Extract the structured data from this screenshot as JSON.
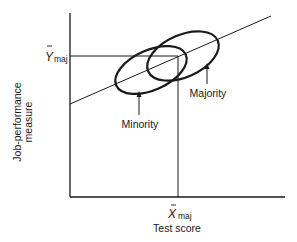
{
  "diagram": {
    "type": "regression-scatter-ellipses",
    "axes": {
      "xlabel": "Test score",
      "ylabel_line1": "Job-performance",
      "ylabel_line2": "measure"
    },
    "markers": {
      "y_mean_symbol": "Y",
      "y_mean_subscript": "maj",
      "x_mean_symbol": "X",
      "x_mean_subscript": "maj"
    },
    "groups": [
      {
        "name": "minority",
        "label": "Minority"
      },
      {
        "name": "majority",
        "label": "Majority"
      }
    ],
    "colors": {
      "ink": "#1a1a1a",
      "background": "#ffffff"
    }
  }
}
